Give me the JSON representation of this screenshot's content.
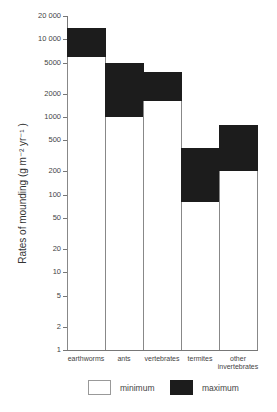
{
  "chart_data": {
    "type": "bar",
    "subtype": "floating-range-bar",
    "title": "",
    "xlabel": "",
    "ylabel": "Rates of mounding (g m⁻² yr⁻¹ )",
    "yscale": "log",
    "ylim": [
      1,
      20000
    ],
    "yticks": [
      1,
      2,
      5,
      10,
      20,
      50,
      100,
      200,
      500,
      1000,
      2000,
      5000,
      10000,
      20000
    ],
    "ytick_labels": [
      "1",
      "2",
      "5",
      "10",
      "20",
      "50",
      "100",
      "200",
      "500",
      "1000",
      "2000",
      "5000",
      "10 000",
      "20 000"
    ],
    "categories": [
      "earthworms",
      "ants",
      "vertebrates",
      "termites",
      "other invertebrates"
    ],
    "series": [
      {
        "name": "minimum",
        "color": "#ffffff",
        "values": [
          6000,
          1000,
          1600,
          80,
          200
        ]
      },
      {
        "name": "maximum",
        "color": "#1c1c1c",
        "values": [
          14000,
          5000,
          3800,
          400,
          800
        ]
      }
    ],
    "legend": {
      "position": "bottom",
      "entries": [
        "minimum",
        "maximum"
      ]
    },
    "grid": false
  },
  "labels": {
    "ylabel": "Rates of mounding (g m⁻² yr⁻¹ )",
    "cat_0": "earthworms",
    "cat_1": "ants",
    "cat_2": "vertebrates",
    "cat_3": "termites",
    "cat_4a": "other",
    "cat_4b": "invertebrates",
    "legend_min": "minimum",
    "legend_max": "maximum"
  }
}
